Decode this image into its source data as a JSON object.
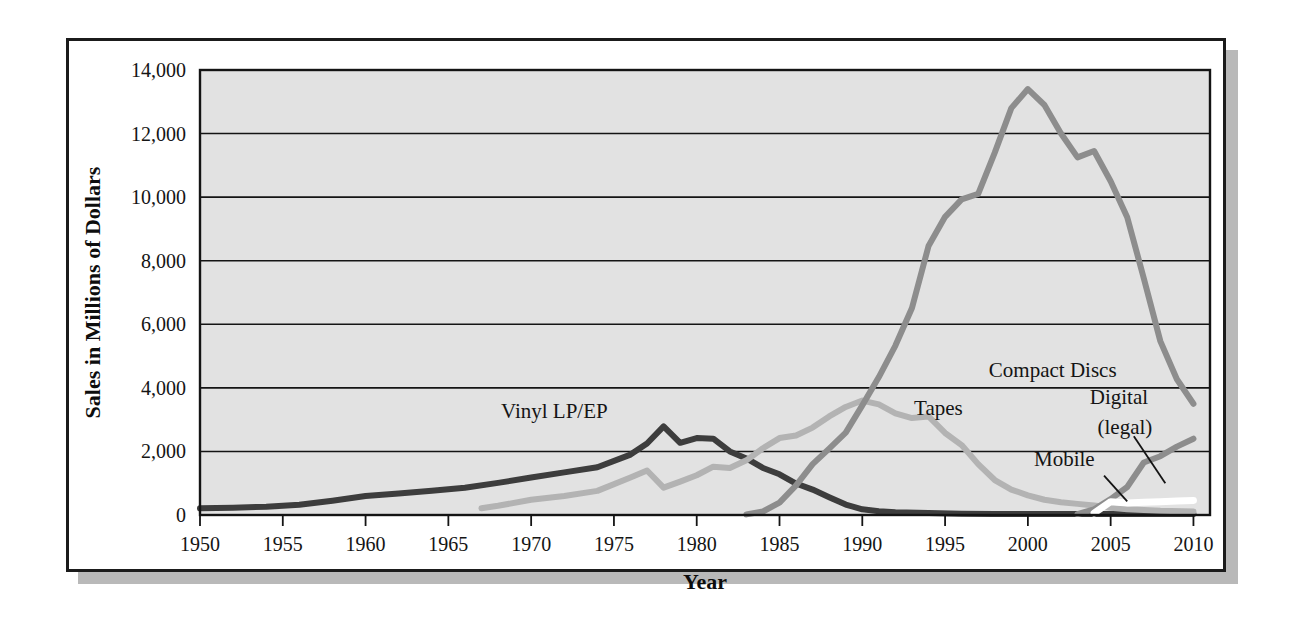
{
  "figure": {
    "background_color": "#ffffff",
    "frame_color": "#1b1b1b",
    "shadow_color": "#b9b9b9",
    "plot_background_color": "#e2e2e2",
    "gridline_color": "#141414"
  },
  "chart_data": {
    "type": "line",
    "title": "",
    "xlabel": "Year",
    "ylabel": "Sales in Millions of Dollars",
    "xlim": [
      1950,
      2011
    ],
    "ylim": [
      0,
      14000
    ],
    "grid": true,
    "legend_position": "inline-labels",
    "xticks": [
      1950,
      1955,
      1960,
      1965,
      1970,
      1975,
      1980,
      1985,
      1990,
      1995,
      2000,
      2005,
      2010
    ],
    "xtick_labels": [
      "1950",
      "1955",
      "1960",
      "1965",
      "1970",
      "1975",
      "1980",
      "1985",
      "1990",
      "1995",
      "2000",
      "2005",
      "2010"
    ],
    "yticks": [
      0,
      2000,
      4000,
      6000,
      8000,
      10000,
      12000,
      14000
    ],
    "ytick_labels": [
      "0",
      "2,000",
      "4,000",
      "6,000",
      "8,000",
      "10,000",
      "12,000",
      "14,000"
    ],
    "series": [
      {
        "name": "Vinyl LP/EP",
        "color": "#3d3d3d",
        "label": "Vinyl LP/EP",
        "label_x": 1971.4,
        "label_y": 3050,
        "x": [
          1950,
          1952,
          1954,
          1956,
          1958,
          1960,
          1962,
          1964,
          1966,
          1968,
          1970,
          1972,
          1974,
          1976,
          1977,
          1978,
          1979,
          1980,
          1981,
          1982,
          1983,
          1984,
          1985,
          1986,
          1987,
          1988,
          1989,
          1990,
          1991,
          1992,
          1994,
          1996,
          1998,
          2000,
          2002,
          2004,
          2006,
          2008,
          2010
        ],
        "y": [
          210,
          230,
          260,
          320,
          450,
          600,
          680,
          760,
          860,
          1010,
          1180,
          1340,
          1500,
          1900,
          2250,
          2790,
          2270,
          2420,
          2400,
          2000,
          1780,
          1480,
          1280,
          990,
          800,
          560,
          330,
          180,
          120,
          90,
          60,
          40,
          35,
          30,
          30,
          30,
          30,
          30,
          30
        ]
      },
      {
        "name": "Tapes",
        "color": "#b3b3b3",
        "label": "Tapes",
        "label_x": 1994.6,
        "label_y": 3150,
        "x": [
          1967,
          1968,
          1970,
          1972,
          1974,
          1976,
          1977,
          1978,
          1979,
          1980,
          1981,
          1982,
          1983,
          1984,
          1985,
          1986,
          1987,
          1988,
          1989,
          1990,
          1991,
          1992,
          1993,
          1994,
          1995,
          1996,
          1997,
          1998,
          1999,
          2000,
          2001,
          2002,
          2003,
          2004,
          2005,
          2006,
          2008,
          2010
        ],
        "y": [
          210,
          290,
          480,
          600,
          760,
          1180,
          1400,
          860,
          1050,
          1250,
          1520,
          1480,
          1720,
          2100,
          2420,
          2500,
          2750,
          3100,
          3400,
          3600,
          3480,
          3200,
          3050,
          3100,
          2580,
          2200,
          1600,
          1100,
          800,
          620,
          480,
          400,
          350,
          300,
          230,
          180,
          130,
          110
        ]
      },
      {
        "name": "Compact Discs",
        "color": "#8d8d8d",
        "label": "Compact Discs",
        "label_x": 2001.5,
        "label_y": 4350,
        "x": [
          1983,
          1984,
          1985,
          1986,
          1987,
          1988,
          1989,
          1990,
          1991,
          1992,
          1993,
          1994,
          1995,
          1996,
          1997,
          1998,
          1999,
          2000,
          2001,
          2002,
          2003,
          2004,
          2005,
          2006,
          2007,
          2008,
          2009,
          2010
        ],
        "y": [
          20,
          110,
          390,
          930,
          1600,
          2090,
          2590,
          3450,
          4340,
          5330,
          6510,
          8460,
          9380,
          9930,
          10100,
          11400,
          12800,
          13400,
          12900,
          12000,
          11250,
          11450,
          10500,
          9370,
          7450,
          5470,
          4270,
          3500
        ]
      },
      {
        "name": "Digital (legal)",
        "color": "#8d8d8d",
        "label": "Digital",
        "label_line2": "(legal)",
        "label_x": 2005.5,
        "label_y": 3500,
        "leader_from_x": 2006.4,
        "leader_from_y": 2480,
        "leader_to_x": 2008.3,
        "leader_to_y": 1000,
        "x": [
          2003,
          2004,
          2005,
          2006,
          2007,
          2008,
          2009,
          2010
        ],
        "y": [
          30,
          180,
          500,
          880,
          1650,
          1850,
          2150,
          2400
        ]
      },
      {
        "name": "Mobile",
        "color": "#ffffff",
        "label": "Mobile",
        "label_x": 2002.2,
        "label_y": 1550,
        "leader_from_x": 2004.6,
        "leader_from_y": 1240,
        "leader_to_x": 2006.0,
        "leader_to_y": 430,
        "x": [
          2004,
          2005,
          2006,
          2007,
          2008,
          2009,
          2010
        ],
        "y": [
          60,
          420,
          380,
          400,
          420,
          440,
          460
        ]
      }
    ]
  }
}
